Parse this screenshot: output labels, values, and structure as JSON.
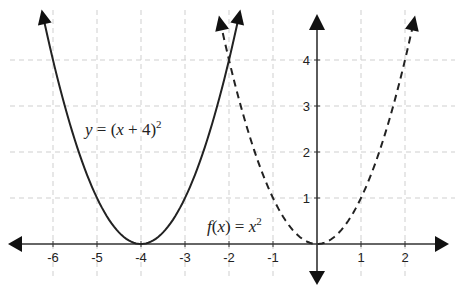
{
  "chart_data": {
    "type": "line",
    "title": "",
    "xlabel": "",
    "ylabel": "",
    "xlim": [
      -6.5,
      2.8
    ],
    "ylim": [
      -0.9,
      5.0
    ],
    "grid": true,
    "legend": null,
    "x_ticks": [
      -6,
      -5,
      -4,
      -3,
      -2,
      -1,
      1,
      2
    ],
    "y_ticks": [
      1,
      2,
      3,
      4
    ],
    "series": [
      {
        "name": "y = (x + 4)^2",
        "style": "solid",
        "function": "(x+4)^2",
        "x_range": [
          -6.23,
          -1.77
        ],
        "vertex": [
          -4,
          0
        ]
      },
      {
        "name": "f(x) = x^2",
        "style": "dashed",
        "function": "x^2",
        "x_range": [
          -2.2,
          2.2
        ],
        "vertex": [
          0,
          0
        ]
      }
    ],
    "annotations": [
      {
        "text": "y = (x + 4)²",
        "x": -5.2,
        "y": 2.35
      },
      {
        "text": "f(x) = x²",
        "x": -2.5,
        "y": 0.25
      }
    ]
  },
  "labels": {
    "x_ticks": [
      "-6",
      "-5",
      "-4",
      "-3",
      "-2",
      "-1",
      "1",
      "2"
    ],
    "y_ticks": [
      "1",
      "2",
      "3",
      "4"
    ],
    "eq_shifted": {
      "y": "y",
      "eq": " = (",
      "x": "x",
      "rest": " + 4)",
      "exp": "2"
    },
    "eq_base": {
      "f": "f",
      "open": "(",
      "x": "x",
      "close": ") = ",
      "x2": "x",
      "exp": "2"
    }
  }
}
